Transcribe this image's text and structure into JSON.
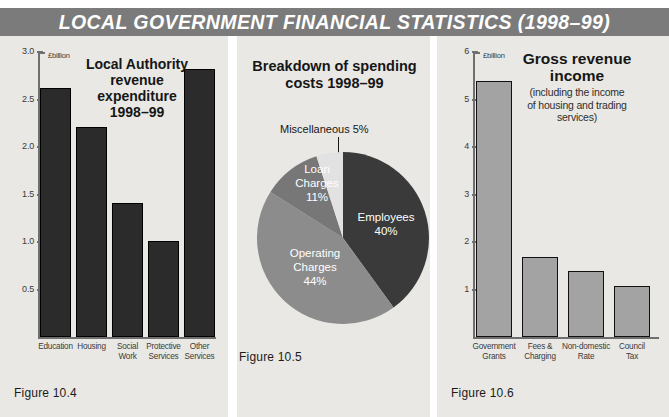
{
  "banner": {
    "title": "LOCAL GOVERNMENT FINANCIAL STATISTICS (1998–99)"
  },
  "colors": {
    "banner_bg": "#7b7b7b",
    "panel_bg": "#e9e8e4",
    "bar_dark": "#2b2b2b",
    "bar_grey": "#a3a3a3",
    "pie_employees": "#3a3a3a",
    "pie_operating": "#8c8c8c",
    "pie_loan": "#777777",
    "pie_misc": "#e2e2e2"
  },
  "left_panel": {
    "figure_caption": "Figure 10.4",
    "unit_label": "£billion",
    "title_lines": [
      "Local Authority",
      "revenue",
      "expenditure",
      "1998–99"
    ]
  },
  "mid_panel": {
    "figure_caption": "Figure 10.5",
    "title_lines": [
      "Breakdown of spending",
      "costs 1998–99"
    ],
    "callout": "Miscellaneous 5%"
  },
  "right_panel": {
    "figure_caption": "Figure 10.6",
    "unit_label": "£billion",
    "title_lines": [
      "Gross revenue",
      "income"
    ],
    "subtitle_lines": [
      "(including the income",
      "of housing and trading",
      "services)"
    ]
  },
  "chart_data": [
    {
      "id": "fig-10-4",
      "type": "bar",
      "title": "Local Authority revenue expenditure 1998–99",
      "xlabel": "",
      "ylabel": "£billion",
      "ylim": [
        0,
        3.0
      ],
      "yticks": [
        0.5,
        1.0,
        1.5,
        2.0,
        2.5,
        3.0
      ],
      "ytick_labels": [
        "0.5",
        "1.0",
        "1.5",
        "2.0",
        "2.5",
        "3.0"
      ],
      "grid": false,
      "legend": "none",
      "categories": [
        "Education",
        "Housing",
        "Social Work",
        "Protective Services",
        "Other Services"
      ],
      "category_lines": [
        [
          "Education"
        ],
        [
          "Housing"
        ],
        [
          "Social",
          "Work"
        ],
        [
          "Protective",
          "Services"
        ],
        [
          "Other",
          "Services"
        ]
      ],
      "values": [
        2.62,
        2.21,
        1.41,
        1.01,
        2.82
      ],
      "color": "#2b2b2b"
    },
    {
      "id": "fig-10-5",
      "type": "pie",
      "title": "Breakdown of spending costs 1998–99",
      "legend": "none",
      "labels": [
        "Employees",
        "Operating Charges",
        "Loan Charges",
        "Miscellaneous"
      ],
      "values": [
        40,
        44,
        11,
        5
      ],
      "value_labels": [
        "40%",
        "44%",
        "11%",
        "5%"
      ],
      "colors": [
        "#3a3a3a",
        "#8c8c8c",
        "#777777",
        "#e2e2e2"
      ],
      "start_angle_deg": 0
    },
    {
      "id": "fig-10-6",
      "type": "bar",
      "title": "Gross revenue income (including the income of housing and trading services)",
      "xlabel": "",
      "ylabel": "£billion",
      "ylim": [
        0,
        6
      ],
      "yticks": [
        1,
        2,
        3,
        4,
        5,
        6
      ],
      "ytick_labels": [
        "1",
        "2",
        "3",
        "4",
        "5",
        "6"
      ],
      "grid": false,
      "legend": "none",
      "categories": [
        "Government Grants",
        "Fees & Charging",
        "Non-domestic Rate",
        "Council Tax"
      ],
      "category_lines": [
        [
          "Government",
          "Grants"
        ],
        [
          "Fees &",
          "Charging"
        ],
        [
          "Non-domestic",
          "Rate"
        ],
        [
          "Council",
          "Tax"
        ]
      ],
      "values": [
        5.4,
        1.68,
        1.4,
        1.08
      ],
      "color": "#a3a3a3"
    }
  ]
}
